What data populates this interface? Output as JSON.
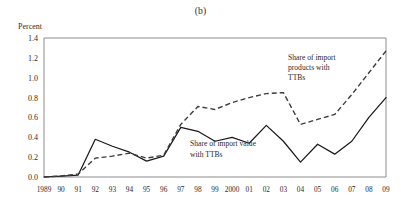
{
  "panel": {
    "title": "(b)",
    "y_axis_title": "Percent"
  },
  "annotations": {
    "products": {
      "line1": "Share of import",
      "line2": "products with",
      "line3": "TTBs"
    },
    "value": {
      "line1": "Share of import value",
      "line2": "with TTBs"
    }
  },
  "chart_data": {
    "type": "line",
    "title": "(b)",
    "xlabel": "",
    "ylabel": "Percent",
    "ylim": [
      0.0,
      1.4
    ],
    "yticks": [
      "0.0",
      "0.2",
      "0.4",
      "0.6",
      "0.8",
      "1.0",
      "1.2",
      "1.4"
    ],
    "ytick_values": [
      0.0,
      0.2,
      0.4,
      0.6,
      0.8,
      1.0,
      1.2,
      1.4
    ],
    "grid": false,
    "legend": "annotations-inline",
    "categories": [
      "1989",
      "90",
      "91",
      "92",
      "93",
      "94",
      "95",
      "96",
      "97",
      "98",
      "99",
      "2000",
      "01",
      "02",
      "03",
      "04",
      "05",
      "06",
      "07",
      "08",
      "09"
    ],
    "series": [
      {
        "name": "Share of import value with TTBs",
        "style": "solid",
        "color": "#1a1a1a",
        "values": [
          0.0,
          0.01,
          0.02,
          0.38,
          0.31,
          0.25,
          0.16,
          0.21,
          0.5,
          0.46,
          0.36,
          0.4,
          0.34,
          0.52,
          0.36,
          0.15,
          0.33,
          0.23,
          0.36,
          0.6,
          0.8
        ]
      },
      {
        "name": "Share of import products with TTBs",
        "style": "dashed",
        "color": "#3c3c3c",
        "values": [
          0.0,
          0.01,
          0.03,
          0.19,
          0.21,
          0.24,
          0.19,
          0.22,
          0.53,
          0.71,
          0.68,
          0.75,
          0.8,
          0.84,
          0.85,
          0.53,
          0.58,
          0.63,
          0.83,
          1.05,
          1.27
        ]
      }
    ]
  }
}
